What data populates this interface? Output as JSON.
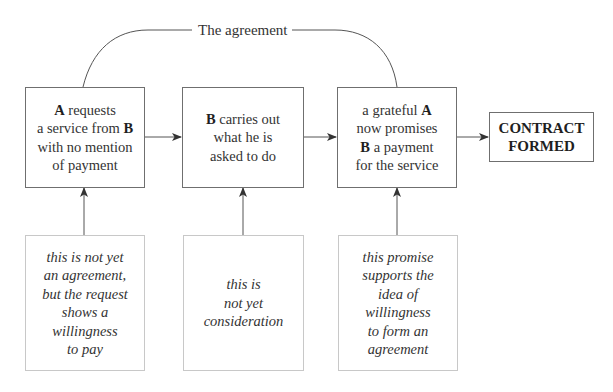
{
  "diagram": {
    "agreement_label": "The agreement",
    "steps": [
      {
        "id": "step-a-requests",
        "lines": [
          [
            {
              "text": "A",
              "bold": true
            },
            {
              "text": " requests"
            }
          ],
          [
            {
              "text": "a service from "
            },
            {
              "text": "B",
              "bold": true
            }
          ],
          [
            {
              "text": "with no mention"
            }
          ],
          [
            {
              "text": "of payment"
            }
          ]
        ]
      },
      {
        "id": "step-b-carries-out",
        "lines": [
          [
            {
              "text": "B",
              "bold": true
            },
            {
              "text": " carries out"
            }
          ],
          [
            {
              "text": "what he is"
            }
          ],
          [
            {
              "text": "asked to do"
            }
          ]
        ]
      },
      {
        "id": "step-a-promises",
        "lines": [
          [
            {
              "text": "a grateful "
            },
            {
              "text": "A",
              "bold": true
            }
          ],
          [
            {
              "text": "now promises"
            }
          ],
          [
            {
              "text": "B",
              "bold": true
            },
            {
              "text": " a payment"
            }
          ],
          [
            {
              "text": "for the service"
            }
          ]
        ]
      }
    ],
    "result": {
      "lines": [
        "CONTRACT",
        "FORMED"
      ]
    },
    "notes": [
      {
        "lines": [
          "this is not yet",
          "an agreement,",
          "but the request",
          "shows a",
          "willingness",
          "to pay"
        ]
      },
      {
        "lines": [
          "this is",
          "not yet",
          "consideration"
        ]
      },
      {
        "lines": [
          "this promise",
          "supports the",
          "idea of",
          "willingness",
          "to form an",
          "agreement"
        ]
      }
    ],
    "colors": {
      "box_border": "#6f6f6f",
      "note_border": "#c8c8c8",
      "line": "#555555",
      "text": "#333333"
    }
  }
}
